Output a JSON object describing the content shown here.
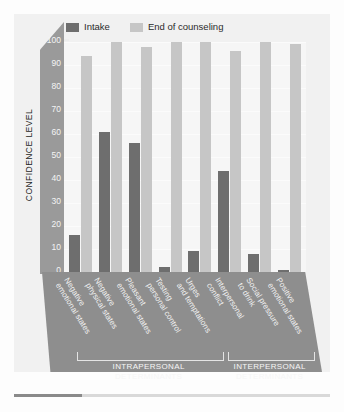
{
  "chart_data": {
    "type": "bar",
    "title": "",
    "xlabel": "",
    "ylabel": "CONFIDENCE LEVEL",
    "ylim": [
      0,
      100
    ],
    "yticks": [
      0,
      10,
      20,
      30,
      40,
      50,
      60,
      70,
      80,
      90,
      100
    ],
    "grid": true,
    "legend_position": "top",
    "categories": [
      "Negative\nemotional states",
      "Negative\nphysical states",
      "Pleasant\nemotional states",
      "Testing\npersonal control",
      "Urges\nand temptations",
      "Interpersonal\nconflict",
      "Social pressure\nto drink",
      "Positive\nemotional states"
    ],
    "category_lines": [
      [
        "Negative",
        "emotional states"
      ],
      [
        "Negative",
        "physical states"
      ],
      [
        "Pleasant",
        "emotional states"
      ],
      [
        "Testing",
        "personal control"
      ],
      [
        "Urges",
        "and temptations"
      ],
      [
        "Interpersonal",
        "conflict"
      ],
      [
        "Social pressure",
        "to drink"
      ],
      [
        "Positive",
        "emotional states"
      ]
    ],
    "series": [
      {
        "name": "Intake",
        "color": "#6e6e6e",
        "values": [
          16,
          61,
          56,
          2,
          9,
          44,
          8,
          1
        ]
      },
      {
        "name": "End of counseling",
        "color": "#c6c6c6",
        "values": [
          94,
          100,
          98,
          100,
          100,
          96,
          100,
          99
        ]
      }
    ],
    "groupings": [
      {
        "label_line1": "INTRAPERSONAL",
        "label_line2": "DETERMINANTS",
        "categories": [
          0,
          1,
          2,
          3,
          4
        ]
      },
      {
        "label_line1": "INTERPERSONAL",
        "label_line2": "DETERMINANTS",
        "categories": [
          5,
          6,
          7
        ]
      }
    ]
  },
  "legend": {
    "items": [
      {
        "label": "Intake",
        "color": "#6e6e6e"
      },
      {
        "label": "End of counseling",
        "color": "#c6c6c6"
      }
    ]
  },
  "axis": {
    "y_title": "CONFIDENCE LEVEL"
  },
  "colors": {
    "intake": "#6e6e6e",
    "end_of_counseling": "#c6c6c6",
    "axis_band": "#9a9a9a",
    "base_plate": "#8e8e8e",
    "plot_background": "#f6f6f6",
    "figure_background": "#f1f1f1"
  }
}
